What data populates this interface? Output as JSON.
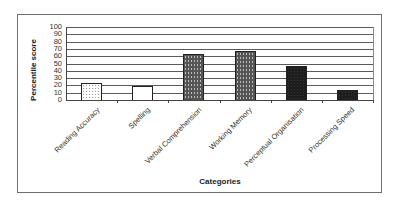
{
  "chart_data": {
    "type": "bar",
    "title": "",
    "xlabel": "Categories",
    "ylabel": "Percentile score",
    "ylim": [
      0,
      100
    ],
    "yticks": [
      "0",
      "10",
      "20",
      "30",
      "40",
      "50",
      "60",
      "70",
      "80",
      "90",
      "100"
    ],
    "grid": true,
    "legend": null,
    "categories": [
      "Reading Accuracy",
      "Spelling",
      "Verbal Comprehension",
      "Working Memory",
      "Perceptual Organisation",
      "Processing Speed"
    ],
    "values": [
      23,
      19,
      63,
      67,
      47,
      14
    ],
    "fills": [
      "light-dotted",
      "white",
      "dark-dotted",
      "dark-dotted",
      "black",
      "black"
    ]
  },
  "labels": {
    "ytitle": "Percentile score",
    "xtitle": "Categories",
    "yticks": [
      "0",
      "10",
      "20",
      "30",
      "40",
      "50",
      "60",
      "70",
      "80",
      "90",
      "100"
    ],
    "categories": [
      "Reading Accuracy",
      "Spelling",
      "Verbal Comprehension",
      "Working Memory",
      "Perceptual Organisation",
      "Processing Speed"
    ]
  }
}
